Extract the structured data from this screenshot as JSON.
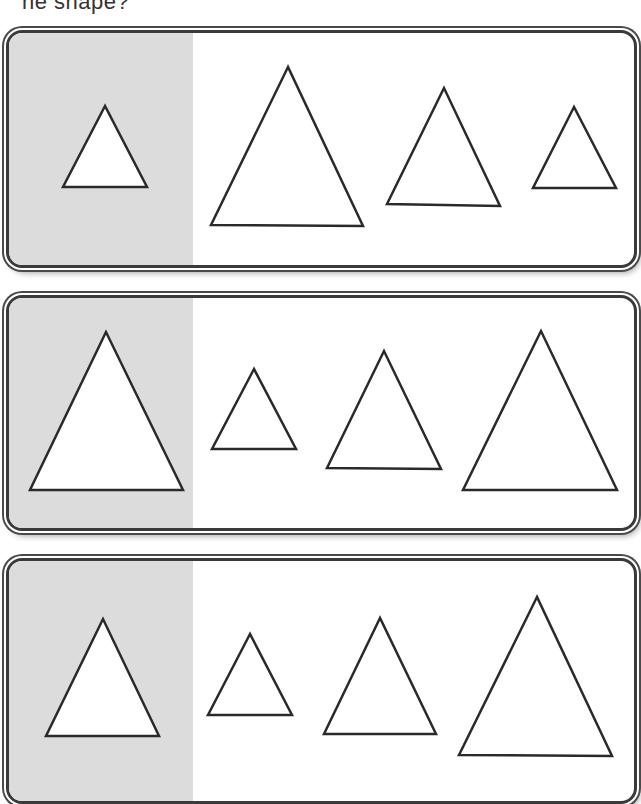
{
  "prompt": "ne shape?",
  "colors": {
    "sample_background": "#dcdcdc",
    "outline": "#2a2a2a",
    "panel_border": "#3a3a3a"
  },
  "panels": [
    {
      "name": "row-1",
      "sample_shape": "triangle",
      "choices": [
        "triangle",
        "triangle",
        "triangle",
        "triangle"
      ]
    },
    {
      "name": "row-2",
      "sample_shape": "triangle",
      "choices": [
        "triangle",
        "triangle",
        "triangle",
        "triangle"
      ]
    },
    {
      "name": "row-3",
      "sample_shape": "triangle",
      "choices": [
        "triangle",
        "triangle",
        "triangle",
        "triangle"
      ]
    }
  ]
}
